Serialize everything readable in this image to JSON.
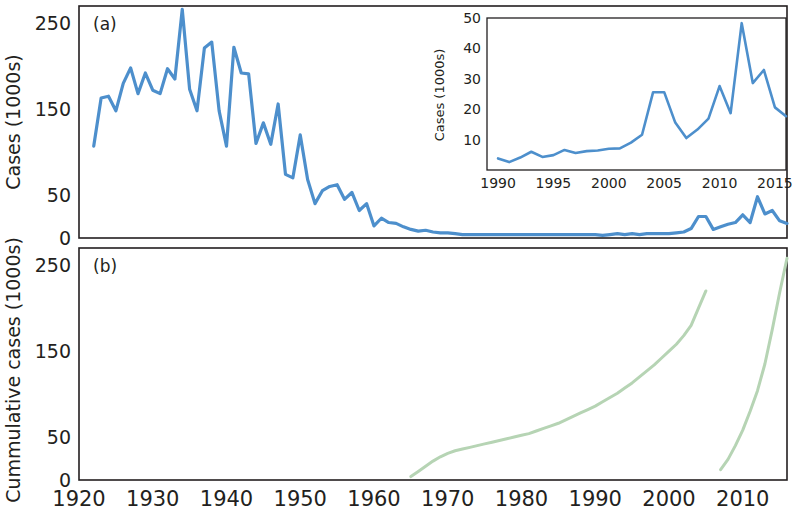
{
  "figure": {
    "background": "#ffffff",
    "series_color_main": "#4d8fcc",
    "series_color_cumulative": "#b6d4b4",
    "axis_color": "#231f20"
  },
  "panel_a": {
    "letter": "(a)",
    "ylabel": "Cases (1000s)"
  },
  "panel_b": {
    "letter": "(b)",
    "ylabel": "Cummulative cases (1000s)"
  },
  "inset": {
    "ylabel": "Cases (1000s)"
  },
  "chart_data": [
    {
      "type": "line",
      "id": "panel-a-annual-cases",
      "title": "(a)",
      "xlabel": "",
      "ylabel": "Cases (1000s)",
      "xlim": [
        1920,
        2016
      ],
      "ylim": [
        0,
        270
      ],
      "yticks": [
        0,
        50,
        150,
        250
      ],
      "ytick_labels": [
        "0",
        "50",
        "150",
        "250"
      ],
      "xticks": [
        1920,
        1930,
        1940,
        1950,
        1960,
        1970,
        1980,
        1990,
        2000,
        2010
      ],
      "xtick_labels": [
        "1920",
        "1930",
        "1940",
        "1950",
        "1960",
        "1970",
        "1980",
        "1990",
        "2000",
        "2010"
      ],
      "grid": false,
      "legend": "none",
      "color": "#4d8fcc",
      "x": [
        1922,
        1923,
        1924,
        1925,
        1926,
        1927,
        1928,
        1929,
        1930,
        1931,
        1932,
        1933,
        1934,
        1935,
        1936,
        1937,
        1938,
        1939,
        1940,
        1941,
        1942,
        1943,
        1944,
        1945,
        1946,
        1947,
        1948,
        1949,
        1950,
        1951,
        1952,
        1953,
        1954,
        1955,
        1956,
        1957,
        1958,
        1959,
        1960,
        1961,
        1962,
        1963,
        1964,
        1965,
        1966,
        1967,
        1968,
        1969,
        1970,
        1971,
        1972,
        1973,
        1974,
        1975,
        1976,
        1977,
        1978,
        1979,
        1980,
        1981,
        1982,
        1983,
        1984,
        1985,
        1986,
        1987,
        1988,
        1989,
        1990,
        1991,
        1992,
        1993,
        1994,
        1995,
        1996,
        1997,
        1998,
        1999,
        2000,
        2001,
        2002,
        2003,
        2004,
        2005,
        2006,
        2007,
        2008,
        2009,
        2010,
        2011,
        2012,
        2013,
        2014,
        2015,
        2016
      ],
      "y": [
        107,
        163,
        165,
        148,
        180,
        198,
        168,
        192,
        172,
        168,
        197,
        185,
        266,
        173,
        148,
        221,
        228,
        148,
        107,
        222,
        192,
        191,
        110,
        134,
        109,
        156,
        74,
        70,
        120,
        68,
        40,
        55,
        60,
        62,
        45,
        53,
        32,
        40,
        14,
        23,
        18,
        17,
        13,
        10,
        8,
        9,
        7,
        6,
        6,
        5,
        4,
        4,
        4,
        4,
        4,
        4,
        4,
        4,
        4,
        4,
        4,
        4,
        4,
        4,
        4,
        4,
        4,
        4,
        4,
        3,
        4,
        5,
        4,
        5,
        4,
        5,
        5,
        5,
        5,
        6,
        7,
        11,
        25,
        25,
        10,
        13,
        16,
        18,
        27,
        18,
        48,
        28,
        32,
        20,
        17
      ]
    },
    {
      "type": "line",
      "id": "inset-recent-cases",
      "title": "",
      "xlabel": "",
      "ylabel": "Cases (1000s)",
      "xlim": [
        1989,
        2016
      ],
      "ylim": [
        0,
        50
      ],
      "yticks": [
        10,
        20,
        30,
        40,
        50
      ],
      "ytick_labels": [
        "10",
        "20",
        "30",
        "40",
        "50"
      ],
      "xticks": [
        1990,
        1995,
        2000,
        2005,
        2010,
        2015
      ],
      "xtick_labels": [
        "1990",
        "1995",
        "2000",
        "2005",
        "2010",
        "2015"
      ],
      "grid": false,
      "legend": "none",
      "color": "#4d8fcc",
      "x": [
        1990,
        1991,
        1992,
        1993,
        1994,
        1995,
        1996,
        1997,
        1998,
        1999,
        2000,
        2001,
        2002,
        2003,
        2004,
        2005,
        2006,
        2007,
        2008,
        2009,
        2010,
        2011,
        2012,
        2013,
        2014,
        2015,
        2016
      ],
      "y": [
        3.8,
        2.6,
        4.1,
        6.0,
        4.3,
        4.9,
        6.6,
        5.6,
        6.2,
        6.4,
        7.0,
        7.1,
        9.0,
        11.6,
        25.6,
        25.6,
        15.6,
        10.5,
        13.3,
        16.9,
        27.6,
        18.7,
        48.3,
        28.6,
        32.9,
        20.6,
        17.7
      ]
    },
    {
      "type": "line",
      "id": "panel-b-cumulative-early",
      "title": "(b)",
      "xlabel": "",
      "ylabel": "Cummulative cases (1000s)",
      "xlim": [
        1920,
        2016
      ],
      "ylim": [
        0,
        270
      ],
      "yticks": [
        0,
        50,
        150,
        250
      ],
      "ytick_labels": [
        "0",
        "50",
        "150",
        "250"
      ],
      "xticks": [
        1920,
        1930,
        1940,
        1950,
        1960,
        1970,
        1980,
        1990,
        2000,
        2010
      ],
      "xtick_labels": [
        "1920",
        "1930",
        "1940",
        "1950",
        "1960",
        "1970",
        "1980",
        "1990",
        "2000",
        "2010"
      ],
      "grid": false,
      "legend": "none",
      "color": "#b6d4b4",
      "series_label": "cumulative cohort 1",
      "x": [
        1965,
        1966,
        1967,
        1968,
        1969,
        1970,
        1971,
        1972,
        1973,
        1974,
        1975,
        1976,
        1977,
        1978,
        1979,
        1980,
        1981,
        1982,
        1983,
        1984,
        1985,
        1986,
        1987,
        1988,
        1989,
        1990,
        1991,
        1992,
        1993,
        1994,
        1995,
        1996,
        1997,
        1998,
        1999,
        2000,
        2001,
        2002,
        2003,
        2004,
        2005
      ],
      "y": [
        4,
        10,
        16,
        22,
        27,
        31,
        34,
        36,
        38,
        40,
        42,
        44,
        46,
        48,
        50,
        52,
        54,
        57,
        60,
        63,
        66,
        70,
        74,
        78,
        82,
        86,
        91,
        96,
        101,
        107,
        113,
        120,
        127,
        134,
        142,
        150,
        158,
        168,
        180,
        200,
        220
      ]
    },
    {
      "type": "line",
      "id": "panel-b-cumulative-recent",
      "title": "",
      "xlabel": "",
      "ylabel": "Cummulative cases (1000s)",
      "xlim": [
        1920,
        2016
      ],
      "ylim": [
        0,
        270
      ],
      "grid": false,
      "legend": "none",
      "color": "#b6d4b4",
      "series_label": "cumulative cohort 2",
      "x": [
        2007,
        2008,
        2009,
        2010,
        2011,
        2012,
        2013,
        2014,
        2015,
        2016
      ],
      "y": [
        12,
        24,
        40,
        58,
        80,
        104,
        135,
        175,
        218,
        258
      ]
    }
  ]
}
